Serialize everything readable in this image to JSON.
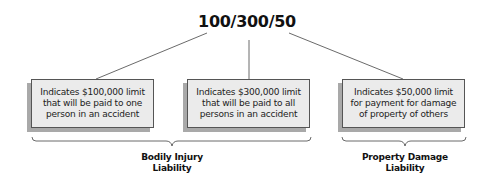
{
  "title": "100/300/50",
  "boxes": [
    {
      "lines": [
        "Indicates $100,000 limit",
        "that will be paid to one",
        "person in an accident"
      ]
    },
    {
      "lines": [
        "Indicates $300,000 limit",
        "that will be paid to all",
        "persons in an accident"
      ]
    },
    {
      "lines": [
        "Indicates $50,000 limit",
        "for payment for damage",
        "of property of others"
      ]
    }
  ],
  "groups": [
    {
      "lines": [
        "Bodily Injury",
        "Liability"
      ]
    },
    {
      "lines": [
        "Property Damage",
        "Liability"
      ]
    }
  ],
  "colors": {
    "box_fill": "#ebebeb",
    "box_shadow": "#a9a9a9",
    "line": "#444444"
  }
}
